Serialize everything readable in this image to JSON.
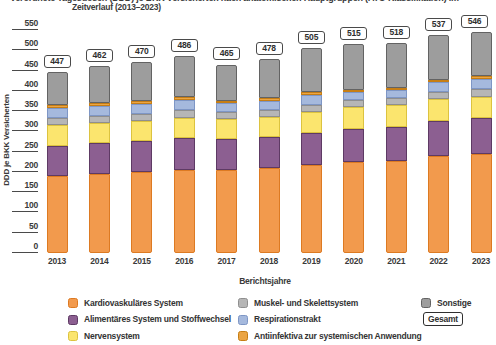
{
  "title": {
    "line1_clipped": "Verordnete Tagesdosen (DDD) je BKK Versicherten nach anatomischen Hauptgruppen (ATC-Klassifikation) im",
    "line2": "Zeitverlauf (2013–2023)"
  },
  "y_axis": {
    "label": "DDD je BKK Versicherten",
    "ticks": [
      550,
      500,
      450,
      400,
      350,
      300,
      250,
      200,
      150,
      100,
      50,
      0
    ]
  },
  "x_axis": {
    "label": "Berichtsjahre"
  },
  "chart_data": {
    "type": "bar",
    "stacked": true,
    "title": "Zeitverlauf (2013–2023)",
    "xlabel": "Berichtsjahre",
    "ylabel": "DDD je BKK Versicherten",
    "ylim": [
      0,
      550
    ],
    "grid": false,
    "legend_position": "bottom",
    "categories": [
      "2013",
      "2014",
      "2015",
      "2016",
      "2017",
      "2018",
      "2019",
      "2020",
      "2021",
      "2022",
      "2023"
    ],
    "totals": [
      447,
      462,
      470,
      486,
      465,
      478,
      505,
      515,
      518,
      537,
      546
    ],
    "series": [
      {
        "key": "kardiovaskulaeres-system",
        "name": "Kardiovaskuläres System",
        "color": "#F29A4D",
        "border": "#DD7A22",
        "values": [
          190,
          195,
          199,
          205,
          204,
          209,
          216,
          224,
          228,
          239,
          243
        ]
      },
      {
        "key": "alimentaeres-system-und-stoffwechsel",
        "name": "Alimentäres System und Stoffwechsel",
        "color": "#8C5F91",
        "border": "#5E3A64",
        "values": [
          75,
          76,
          77,
          78,
          76,
          77,
          80,
          83,
          84,
          87,
          89
        ]
      },
      {
        "key": "nervensystem",
        "name": "Nervensystem",
        "color": "#FBE56E",
        "border": "#DCC33F",
        "values": [
          50,
          50,
          50,
          51,
          50,
          50,
          51,
          52,
          53,
          53,
          54
        ]
      },
      {
        "key": "muskel-und-skelettsystem",
        "name": "Muskel- und Skelettsystem",
        "color": "#B6B6B6",
        "border": "#8F8F8F",
        "values": [
          18,
          18,
          18,
          18,
          17,
          17,
          18,
          18,
          18,
          18,
          18
        ]
      },
      {
        "key": "respirationstrakt",
        "name": "Respirationstrakt",
        "color": "#A5B9DD",
        "border": "#7E96C5",
        "values": [
          24,
          24,
          24,
          25,
          22,
          23,
          24,
          19,
          18,
          24,
          26
        ]
      },
      {
        "key": "antiinfektiva-zur-systemischen-anwendung",
        "name": "Antiinfektiva zur systemischen Anwendung",
        "color": "#EBA544",
        "border": "#C67E15",
        "values": [
          8,
          8,
          8,
          8,
          7,
          7,
          8,
          6,
          6,
          7,
          7
        ]
      },
      {
        "key": "sonstige",
        "name": "Sonstige",
        "color": "#9D9D9D",
        "border": "#636363",
        "values": [
          82,
          91,
          94,
          101,
          89,
          95,
          108,
          113,
          111,
          109,
          109
        ]
      }
    ]
  },
  "legend": {
    "columns": [
      [
        0,
        1,
        2
      ],
      [
        3,
        4,
        5
      ],
      [
        6
      ]
    ],
    "gesamt_label": "Gesamt"
  }
}
